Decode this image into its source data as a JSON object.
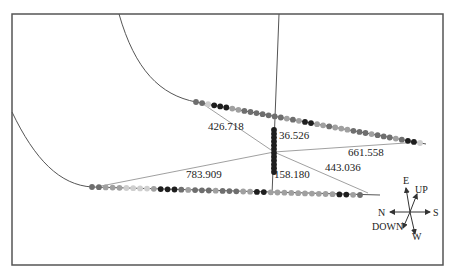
{
  "frame": {
    "x": 12,
    "y": 14,
    "width": 431,
    "height": 251,
    "stroke": "#555555"
  },
  "colors": {
    "line": "#555555",
    "thin_line": "#888888",
    "dot_dark": "#1e1e1e",
    "dot_mid": "#6e6e6e",
    "dot_light": "#a0a0a0",
    "dot_pale": "#cfcfcf"
  },
  "curves": {
    "upper_curve": "M119,14 C135,70 160,95 196,102",
    "lower_curve": "M12,112 C35,160 60,185 92,187"
  },
  "wells": {
    "upper": {
      "x1": 196,
      "y1": 102,
      "x2": 426,
      "y2": 144
    },
    "lower": {
      "x1": 92,
      "y1": 187,
      "x2": 380,
      "y2": 195
    },
    "vertical": {
      "x1": 279,
      "y1": 14,
      "x2": 272,
      "y2": 195
    }
  },
  "distance_lines": [
    {
      "name": "line-426-718",
      "x1": 203,
      "y1": 104,
      "x2": 274,
      "y2": 152
    },
    {
      "name": "line-443-036",
      "x1": 274,
      "y1": 152,
      "x2": 368,
      "y2": 193
    },
    {
      "name": "line-783-909",
      "x1": 96,
      "y1": 187,
      "x2": 274,
      "y2": 152
    },
    {
      "name": "line-661-558",
      "x1": 274,
      "y1": 152,
      "x2": 420,
      "y2": 142
    }
  ],
  "labels": [
    {
      "text": "426.718",
      "x": 208,
      "y": 130
    },
    {
      "text": "36.526",
      "x": 279,
      "y": 139
    },
    {
      "text": "661.558",
      "x": 348,
      "y": 156
    },
    {
      "text": "783.909",
      "x": 186,
      "y": 178
    },
    {
      "text": "158.180",
      "x": 274,
      "y": 178
    },
    {
      "text": "443.036",
      "x": 325,
      "y": 171
    }
  ],
  "vertical_column": {
    "x": 274,
    "y_start": 130,
    "y_end": 172,
    "count": 12
  },
  "upper_dots": [
    "mid",
    "mid",
    "pale",
    "dark",
    "dark",
    "dark",
    "light",
    "light",
    "mid",
    "mid",
    "mid",
    "mid",
    "mid",
    "mid",
    "mid",
    "light",
    "mid",
    "light",
    "dark",
    "dark",
    "light",
    "light",
    "mid",
    "light",
    "light",
    "light",
    "mid",
    "mid",
    "mid",
    "light",
    "mid",
    "mid",
    "mid",
    "light",
    "mid",
    "dark",
    "dark",
    "pale"
  ],
  "lower_dots": [
    "mid",
    "mid",
    "light",
    "light",
    "light",
    "pale",
    "pale",
    "pale",
    "pale",
    "light",
    "dark",
    "dark",
    "dark",
    "mid",
    "light",
    "mid",
    "mid",
    "mid",
    "light",
    "mid",
    "mid",
    "mid",
    "light",
    "light",
    "dark",
    "dark",
    "light",
    "light",
    "light",
    "light",
    "light",
    "light",
    "light",
    "light",
    "light",
    "light",
    "dark",
    "dark",
    "light",
    "mid"
  ],
  "compass": {
    "cx": 410,
    "cy": 212,
    "E": "E",
    "UP": "UP",
    "N": "N",
    "S": "S",
    "DOWN": "DOWN",
    "W": "W"
  }
}
